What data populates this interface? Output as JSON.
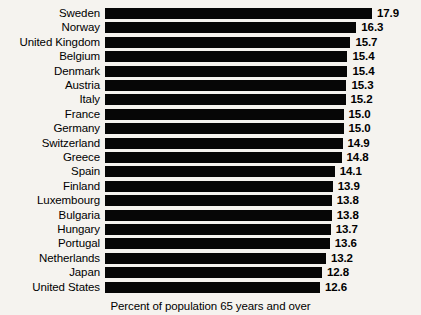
{
  "chart_data": {
    "type": "bar",
    "orientation": "horizontal",
    "title": "",
    "subtitle": "",
    "xlabel": "Percent of population 65 years and over",
    "ylabel": "",
    "grid": false,
    "legend": null,
    "value_labels_shown": true,
    "value_label_format": "one-decimal",
    "bar_color": "#060606",
    "background_color": "#f5f3ef",
    "text_color": "#000000",
    "axis_note": "bars share a common left start; value axis is truncated (does not begin at zero)",
    "xlim": [
      12.6,
      17.9
    ],
    "categories": [
      "Sweden",
      "Norway",
      "United Kingdom",
      "Belgium",
      "Denmark",
      "Austria",
      "Italy",
      "France",
      "Germany",
      "Switzerland",
      "Greece",
      "Spain",
      "Finland",
      "Luxembourg",
      "Bulgaria",
      "Hungary",
      "Portugal",
      "Netherlands",
      "Japan",
      "United States"
    ],
    "values": [
      17.9,
      16.3,
      15.7,
      15.4,
      15.4,
      15.3,
      15.2,
      15.0,
      15.0,
      14.9,
      14.8,
      14.1,
      13.9,
      13.8,
      13.8,
      13.7,
      13.6,
      13.2,
      12.8,
      12.6
    ],
    "value_labels": [
      "17.9",
      "16.3",
      "15.7",
      "15.4",
      "15.4",
      "15.3",
      "15.2",
      "15.0",
      "15.0",
      "14.9",
      "14.8",
      "14.1",
      "13.9",
      "13.8",
      "13.8",
      "13.7",
      "13.6",
      "13.2",
      "12.8",
      "12.6"
    ]
  },
  "footer": {
    "caption": "Percent of population 65 years and over"
  }
}
